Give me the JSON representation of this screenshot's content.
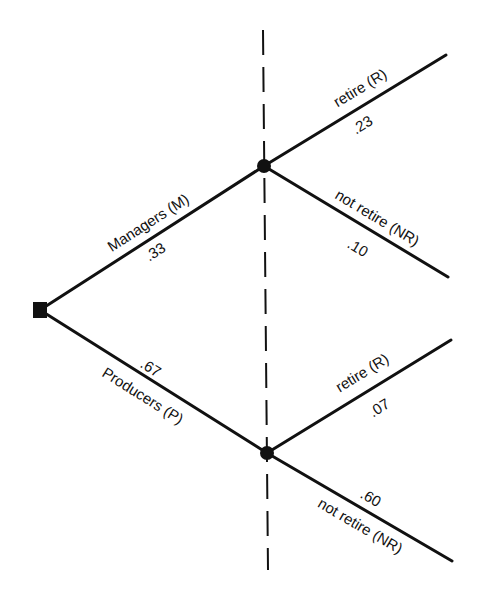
{
  "diagram": {
    "type": "probability-tree",
    "root": {
      "shape": "square",
      "x": 40,
      "y": 310
    },
    "divider": {
      "style": "dashed",
      "x1": 263,
      "y1": 30,
      "x2": 268,
      "y2": 570
    },
    "colors": {
      "ink": "#111111",
      "background": "#ffffff"
    },
    "branches": [
      {
        "label": "Managers (M)",
        "probability": ".33",
        "from": [
          40,
          310
        ],
        "to": [
          264,
          166
        ],
        "node": {
          "shape": "dot",
          "x": 264,
          "y": 166
        },
        "children": [
          {
            "label": "retire (R)",
            "probability": ".23",
            "from": [
              264,
              166
            ],
            "to": [
              446,
              55
            ]
          },
          {
            "label": "not retire (NR)",
            "probability": ".10",
            "from": [
              264,
              166
            ],
            "to": [
              448,
              277
            ]
          }
        ]
      },
      {
        "label": "Producers (P)",
        "probability": ".67",
        "from": [
          40,
          310
        ],
        "to": [
          267,
          453
        ],
        "node": {
          "shape": "dot",
          "x": 267,
          "y": 453
        },
        "children": [
          {
            "label": "retire (R)",
            "probability": ".07",
            "from": [
              267,
              453
            ],
            "to": [
              451,
              340
            ]
          },
          {
            "label": "not retire (NR)",
            "probability": ".60",
            "from": [
              267,
              453
            ],
            "to": [
              452,
              561
            ]
          }
        ]
      }
    ]
  }
}
